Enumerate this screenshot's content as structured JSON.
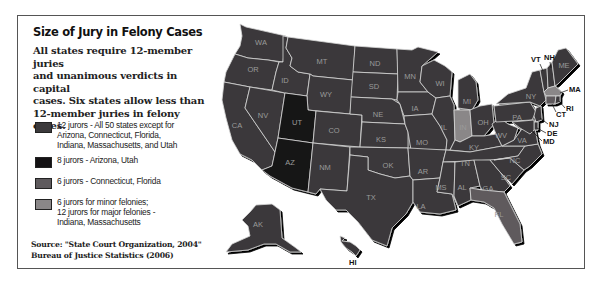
{
  "title": "Size of Jury in Felony Cases",
  "intro": {
    "lines": [
      "All states require 12-member juries",
      "and unanimous verdicts in capital",
      "cases. Six states allow less than",
      "12-member juries in felony cases."
    ]
  },
  "colors": {
    "twelve": "#3b393b",
    "eight": "#141214",
    "six": "#5e5a5d",
    "mixed": "#8a8788",
    "border": "#d8d8d8",
    "label": "#9a9a9a"
  },
  "legend": [
    {
      "category": "twelve",
      "lines": [
        "12 jurors - All 50 states except for",
        "Arizona, Connecticut, Florida,",
        "Indiana, Massachusetts, and Utah"
      ]
    },
    {
      "category": "eight",
      "lines": [
        "8 jurors - Arizona, Utah"
      ]
    },
    {
      "category": "six",
      "lines": [
        "6 jurors - Connecticut, Florida"
      ]
    },
    {
      "category": "mixed",
      "lines": [
        "6 jurors for minor felonies;",
        "12 jurors for major felonies -",
        "Indiana, Massachusetts"
      ]
    }
  ],
  "source": {
    "line1": "Source: \"State Court Organization, 2004\"",
    "line2": "Bureau of Justice Statistics (2006)"
  },
  "states": [
    {
      "abbr": "WA",
      "category": "twelve"
    },
    {
      "abbr": "OR",
      "category": "twelve"
    },
    {
      "abbr": "CA",
      "category": "twelve"
    },
    {
      "abbr": "NV",
      "category": "twelve"
    },
    {
      "abbr": "ID",
      "category": "twelve"
    },
    {
      "abbr": "MT",
      "category": "twelve"
    },
    {
      "abbr": "WY",
      "category": "twelve"
    },
    {
      "abbr": "UT",
      "category": "eight"
    },
    {
      "abbr": "AZ",
      "category": "eight"
    },
    {
      "abbr": "CO",
      "category": "twelve"
    },
    {
      "abbr": "NM",
      "category": "twelve"
    },
    {
      "abbr": "ND",
      "category": "twelve"
    },
    {
      "abbr": "SD",
      "category": "twelve"
    },
    {
      "abbr": "NE",
      "category": "twelve"
    },
    {
      "abbr": "KS",
      "category": "twelve"
    },
    {
      "abbr": "OK",
      "category": "twelve"
    },
    {
      "abbr": "TX",
      "category": "twelve"
    },
    {
      "abbr": "MN",
      "category": "twelve"
    },
    {
      "abbr": "IA",
      "category": "twelve"
    },
    {
      "abbr": "MO",
      "category": "twelve"
    },
    {
      "abbr": "AR",
      "category": "twelve"
    },
    {
      "abbr": "LA",
      "category": "twelve"
    },
    {
      "abbr": "WI",
      "category": "twelve"
    },
    {
      "abbr": "IL",
      "category": "twelve"
    },
    {
      "abbr": "MI",
      "category": "twelve"
    },
    {
      "abbr": "IN",
      "category": "mixed"
    },
    {
      "abbr": "OH",
      "category": "twelve"
    },
    {
      "abbr": "KY",
      "category": "twelve"
    },
    {
      "abbr": "TN",
      "category": "twelve"
    },
    {
      "abbr": "MS",
      "category": "twelve"
    },
    {
      "abbr": "AL",
      "category": "twelve"
    },
    {
      "abbr": "GA",
      "category": "twelve"
    },
    {
      "abbr": "FL",
      "category": "six"
    },
    {
      "abbr": "SC",
      "category": "twelve"
    },
    {
      "abbr": "NC",
      "category": "twelve"
    },
    {
      "abbr": "VA",
      "category": "twelve"
    },
    {
      "abbr": "WV",
      "category": "twelve"
    },
    {
      "abbr": "PA",
      "category": "twelve"
    },
    {
      "abbr": "NY",
      "category": "twelve"
    },
    {
      "abbr": "VT",
      "category": "twelve"
    },
    {
      "abbr": "NH",
      "category": "twelve"
    },
    {
      "abbr": "ME",
      "category": "twelve"
    },
    {
      "abbr": "MA",
      "category": "mixed"
    },
    {
      "abbr": "RI",
      "category": "twelve"
    },
    {
      "abbr": "CT",
      "category": "six"
    },
    {
      "abbr": "NJ",
      "category": "twelve"
    },
    {
      "abbr": "DE",
      "category": "twelve"
    },
    {
      "abbr": "MD",
      "category": "twelve"
    },
    {
      "abbr": "AK",
      "category": "twelve"
    },
    {
      "abbr": "HI",
      "category": "twelve"
    }
  ]
}
